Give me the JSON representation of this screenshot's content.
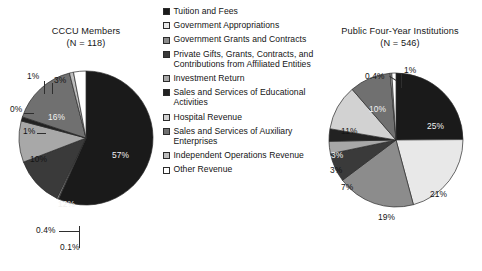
{
  "figure": {
    "background": "#ffffff",
    "type": "two-pie-panel"
  },
  "legend": {
    "position": "center",
    "items": [
      {
        "label": "Tuition and Fees",
        "color": "#1a1a1a",
        "key": "tuition-and-fees"
      },
      {
        "label": "Government Appropriations",
        "color": "#e8e8e8",
        "key": "government-appropriations"
      },
      {
        "label": "Government Grants and Contracts",
        "color": "#8c8c8c",
        "key": "government-grants-and-contracts"
      },
      {
        "label": "Private Gifts, Grants, Contracts, and Contributions from Affiliated Entities",
        "color": "#3a3a3a",
        "key": "private-gifts-grants-contracts"
      },
      {
        "label": "Investment Return",
        "color": "#a8a8a8",
        "key": "investment-return"
      },
      {
        "label": "Sales and Services of Educational Activities",
        "color": "#222222",
        "key": "sales-services-educational-activities"
      },
      {
        "label": "Hospital Revenue",
        "color": "#d2d2d2",
        "key": "hospital-revenue"
      },
      {
        "label": "Sales and Services of Auxiliary Enterprises",
        "color": "#707070",
        "key": "sales-services-auxiliary-enterprises"
      },
      {
        "label": "Independent Operations Revenue",
        "color": "#bdbdbd",
        "key": "independent-operations-revenue"
      },
      {
        "label": "Other Revenue",
        "color": "#ffffff",
        "key": "other-revenue"
      }
    ]
  },
  "chart_data": [
    {
      "type": "pie",
      "id": "cccu-members",
      "title": "CCCU Members",
      "subtitle": "(N = 118)",
      "n": 118,
      "categories": [
        "Tuition and Fees",
        "Government Appropriations",
        "Government Grants and Contracts",
        "Private Gifts, Grants, Contracts, and Contributions from Affiliated Entities",
        "Investment Return",
        "Sales and Services of Educational Activities",
        "Hospital Revenue",
        "Sales and Services of Auxiliary Enterprises",
        "Independent Operations Revenue",
        "Other Revenue"
      ],
      "values": [
        57,
        0.1,
        0.4,
        12,
        10,
        1,
        0,
        16,
        1,
        3
      ],
      "labels": [
        "57%",
        "0.1%",
        "0.4%",
        "12%",
        "10%",
        "1%",
        "0%",
        "16%",
        "1%",
        "3%"
      ],
      "colors": [
        "#1a1a1a",
        "#e8e8e8",
        "#8c8c8c",
        "#3a3a3a",
        "#a8a8a8",
        "#222222",
        "#d2d2d2",
        "#707070",
        "#bdbdbd",
        "#ffffff"
      ],
      "units": "percent"
    },
    {
      "type": "pie",
      "id": "public-four-year-institutions",
      "title": "Public Four-Year Institutions",
      "subtitle": "(N = 546)",
      "n": 546,
      "categories": [
        "Tuition and Fees",
        "Government Appropriations",
        "Government Grants and Contracts",
        "Private Gifts, Grants, Contracts, and Contributions from Affiliated Entities",
        "Investment Return",
        "Sales and Services of Educational Activities",
        "Hospital Revenue",
        "Sales and Services of Auxiliary Enterprises",
        "Independent Operations Revenue",
        "Other Revenue"
      ],
      "values": [
        25,
        21,
        19,
        7,
        3,
        3,
        11,
        10,
        0.4,
        1
      ],
      "labels": [
        "25%",
        "21%",
        "19%",
        "7%",
        "3%",
        "3%",
        "11%",
        "10%",
        "0.4%",
        "1%"
      ],
      "colors": [
        "#1a1a1a",
        "#e8e8e8",
        "#8c8c8c",
        "#3a3a3a",
        "#a8a8a8",
        "#222222",
        "#d2d2d2",
        "#707070",
        "#bdbdbd",
        "#ffffff"
      ],
      "units": "percent"
    }
  ],
  "left_pie_labels": {
    "l0": "57%",
    "l1": "0.1%",
    "l2": "0.4%",
    "l3": "12%",
    "l4": "10%",
    "l5": "1%",
    "l6": "0%",
    "l7": "16%",
    "l8": "1%",
    "l9": "3%"
  },
  "right_pie_labels": {
    "r0": "25%",
    "r1": "21%",
    "r2": "19%",
    "r3": "7%",
    "r4": "3%",
    "r5": "3%",
    "r6": "11%",
    "r7": "10%",
    "r8": "0.4%",
    "r9": "1%"
  }
}
